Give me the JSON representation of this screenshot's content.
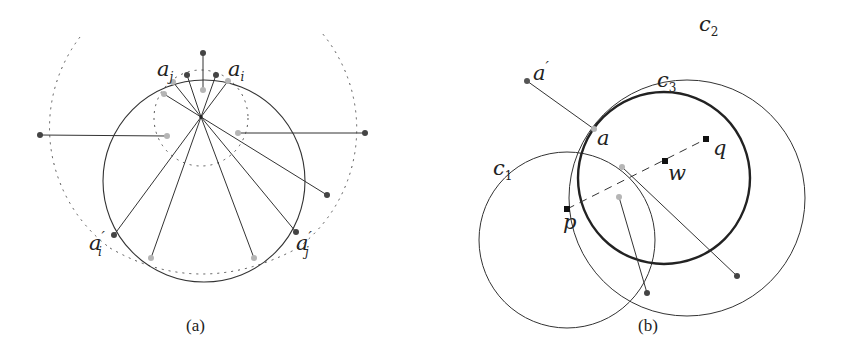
{
  "figure": {
    "panels": [
      {
        "id": "a",
        "caption": "(a)",
        "labels": {
          "a_j": {
            "base": "a",
            "sub": "j",
            "prime": ""
          },
          "a_i": {
            "base": "a",
            "sub": "i",
            "prime": ""
          },
          "a_i_prime": {
            "base": "a",
            "sub": "i",
            "prime": "′"
          },
          "a_j_prime": {
            "base": "a",
            "sub": "j",
            "prime": "′"
          }
        }
      },
      {
        "id": "b",
        "caption": "(b)",
        "labels": {
          "a_prime": {
            "base": "a",
            "prime": "′"
          },
          "a": {
            "base": "a"
          },
          "p": {
            "base": "p"
          },
          "q": {
            "base": "q"
          },
          "w": {
            "base": "w"
          },
          "c1": {
            "base": "c",
            "sub": "1"
          },
          "c2": {
            "base": "c",
            "sub": "2"
          },
          "c3": {
            "base": "c",
            "sub": "3"
          }
        }
      }
    ],
    "colors": {
      "stroke": "#333333",
      "dark_point": "#444444",
      "light_point": "#b5b5b5",
      "square_point": "#111111"
    }
  }
}
